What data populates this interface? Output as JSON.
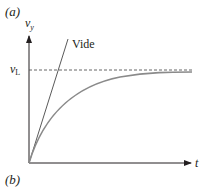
{
  "figure": {
    "panel_top_label": "(a)",
    "panel_bottom_label": "(b)",
    "y_axis_label": "v",
    "y_axis_subscript": "y",
    "x_axis_label": "t",
    "terminal_label": "v",
    "terminal_subscript": "L",
    "line_label": "Vide"
  },
  "colors": {
    "axis": "#231f20",
    "curve": "#8a8a8a",
    "dashed": "#555555",
    "line": "#5a5a5a"
  }
}
